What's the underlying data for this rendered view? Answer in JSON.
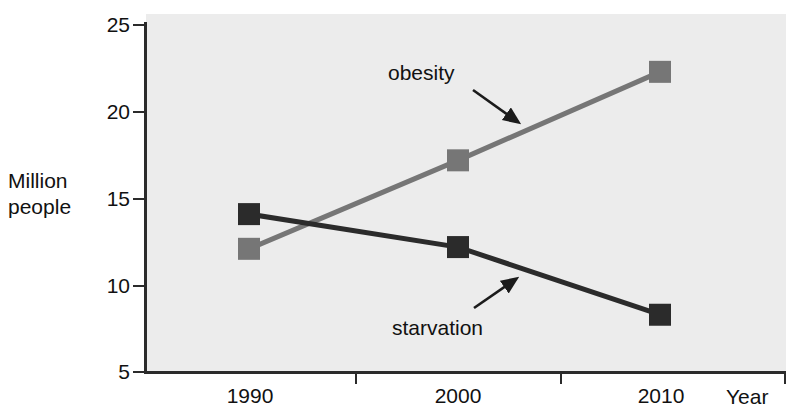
{
  "chart_data": {
    "type": "line",
    "title": "",
    "subtitle": "",
    "xlabel": "Year",
    "ylabel": "Million people",
    "categories": [
      "1990",
      "2000",
      "2010"
    ],
    "x": [
      1990,
      2000,
      2010
    ],
    "xlim": [
      1985,
      2015
    ],
    "ylim": [
      5,
      25
    ],
    "ytick_labels": [
      "25",
      "20",
      "15",
      "10",
      "5"
    ],
    "yticks": [
      25,
      20,
      15,
      10,
      5
    ],
    "grid": false,
    "legend_position": "inline-annotations",
    "series": [
      {
        "name": "obesity",
        "color": "#767676",
        "marker": "square",
        "values": [
          12.1,
          17.2,
          22.3
        ]
      },
      {
        "name": "starvation",
        "color": "#2b2b2b",
        "marker": "square",
        "values": [
          14.1,
          12.2,
          8.3
        ]
      }
    ],
    "annotations": [
      {
        "text": "obesity",
        "series": "obesity",
        "arrow": "down-right"
      },
      {
        "text": "starvation",
        "series": "starvation",
        "arrow": "up-right"
      }
    ]
  },
  "axes": {
    "y_title_line1": "Million",
    "y_title_line2": "people",
    "x_title": "Year"
  },
  "labels": {
    "y_25": "25",
    "y_20": "20",
    "y_15": "15",
    "y_10": "10",
    "y_5": "5",
    "x_1990": "1990",
    "x_2000": "2000",
    "x_2010": "2010",
    "obesity": "obesity",
    "starvation": "starvation"
  }
}
